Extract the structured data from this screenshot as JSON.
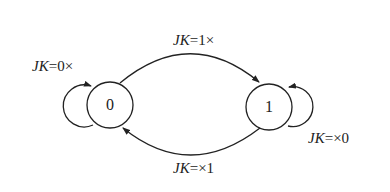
{
  "diagram": {
    "type": "state-transition",
    "states": [
      {
        "id": "s0",
        "label": "0"
      },
      {
        "id": "s1",
        "label": "1"
      }
    ],
    "transitions": [
      {
        "from": "0",
        "to": "0",
        "var": "JK",
        "cond": "=0×"
      },
      {
        "from": "0",
        "to": "1",
        "var": "JK",
        "cond": "=1×"
      },
      {
        "from": "1",
        "to": "1",
        "var": "JK",
        "cond": "=×0"
      },
      {
        "from": "1",
        "to": "0",
        "var": "JK",
        "cond": "=×1"
      }
    ],
    "colors": {
      "stroke": "#222222",
      "background": "#ffffff"
    }
  }
}
